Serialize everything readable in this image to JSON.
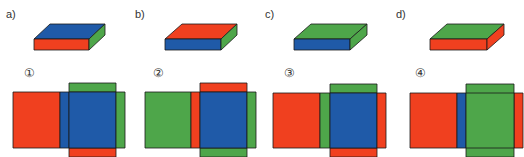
{
  "colors": {
    "red": "#f0401f",
    "blue": "#1f5aa8",
    "green": "#4ea64a",
    "stroke": "#1a1a1a"
  },
  "header": {
    "cut_text": ""
  },
  "boxes": [
    {
      "label": "a)",
      "top": "#1f5aa8",
      "front": "#f0401f",
      "side": "#4ea64a"
    },
    {
      "label": "b)",
      "top": "#f0401f",
      "front": "#1f5aa8",
      "side": "#4ea64a"
    },
    {
      "label": "c)",
      "top": "#4ea64a",
      "front": "#1f5aa8",
      "side": "#4ea64a"
    },
    {
      "label": "d)",
      "top": "#4ea64a",
      "front": "#f0401f",
      "side": "#f0401f"
    }
  ],
  "nets": [
    {
      "number": "①",
      "left": "#f0401f",
      "strip": "#1f5aa8",
      "main": "#1f5aa8",
      "top_flap": "#4ea64a",
      "right_strip": "#4ea64a",
      "bottom_flap": "#f0401f"
    },
    {
      "number": "②",
      "left": "#4ea64a",
      "strip": "#f0401f",
      "main": "#1f5aa8",
      "top_flap": "#f0401f",
      "right_strip": "#4ea64a",
      "bottom_flap": "#4ea64a"
    },
    {
      "number": "③",
      "left": "#f0401f",
      "strip": "#4ea64a",
      "main": "#1f5aa8",
      "top_flap": "#4ea64a",
      "right_strip": "#f0401f",
      "bottom_flap": "#f0401f"
    },
    {
      "number": "④",
      "left": "#f0401f",
      "strip": "#1f5aa8",
      "main": "#4ea64a",
      "top_flap": "#4ea64a",
      "right_strip": "#f0401f",
      "bottom_flap": "#4ea64a"
    }
  ]
}
